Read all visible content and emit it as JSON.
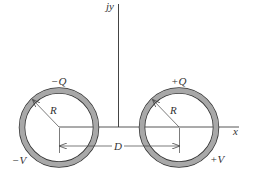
{
  "diagram": {
    "axis_labels": {
      "y": "jy",
      "x": "x"
    },
    "conductors": [
      {
        "id": "left",
        "charge_label": "−Q",
        "voltage_label": "−V",
        "radius_label": "R"
      },
      {
        "id": "right",
        "charge_label": "+Q",
        "voltage_label": "+V",
        "radius_label": "R"
      }
    ],
    "separation_label": "D",
    "colors": {
      "ring_fill": "#a8a8a8",
      "ring_stroke": "#333333",
      "line": "#444444"
    }
  }
}
